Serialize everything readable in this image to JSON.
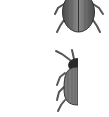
{
  "sprites": [
    {
      "name": "beetle-full",
      "description": "Full beetle, top view, cropped at top edge"
    },
    {
      "name": "beetle-half",
      "description": "Beetle, right half cut off"
    }
  ],
  "colors": {
    "body": "#7a7a7a",
    "body_dark": "#3a3a3a",
    "legs": "#555555",
    "background": "#ffffff"
  }
}
